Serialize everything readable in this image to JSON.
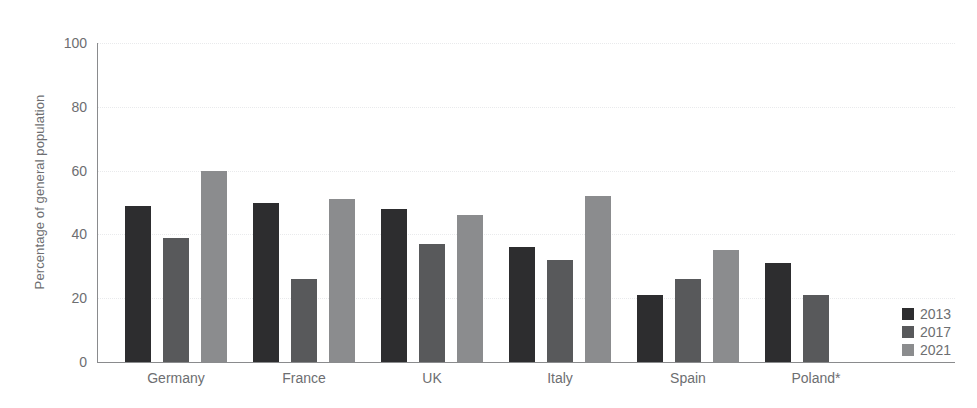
{
  "chart_data": {
    "type": "bar",
    "title": "",
    "subtitle": "",
    "xlabel": "",
    "ylabel": "Percentage of general population",
    "ylim": [
      0,
      100
    ],
    "yticks": [
      0,
      20,
      40,
      60,
      80,
      100
    ],
    "grid": true,
    "legend_position": "right-bottom",
    "categories": [
      "Germany",
      "France",
      "UK",
      "Italy",
      "Spain",
      "Poland*"
    ],
    "series": [
      {
        "name": "2013",
        "color": "#2d2d2f",
        "values": [
          49,
          50,
          48,
          36,
          21,
          31
        ]
      },
      {
        "name": "2017",
        "color": "#58595b",
        "values": [
          39,
          26,
          37,
          32,
          26,
          21
        ]
      },
      {
        "name": "2021",
        "color": "#8b8c8e",
        "values": [
          60,
          51,
          46,
          52,
          35,
          null
        ]
      }
    ]
  },
  "axis": {
    "tick_labels": [
      "0",
      "20",
      "40",
      "60",
      "80",
      "100"
    ]
  },
  "legend": {
    "items": [
      {
        "label": "2013",
        "color": "#2d2d2f"
      },
      {
        "label": "2017",
        "color": "#58595b"
      },
      {
        "label": "2021",
        "color": "#8b8c8e"
      }
    ]
  }
}
